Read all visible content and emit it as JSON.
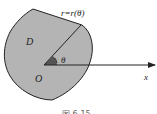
{
  "diagram": {
    "curve_label": "r=r(θ)",
    "region_label": "D",
    "origin_label": "O",
    "angle_label": "θ",
    "axis_label": "x",
    "caption": "图 6-15",
    "colors": {
      "region_fill": "#b4b4b4",
      "stroke": "#222222",
      "background": "#ffffff"
    }
  }
}
